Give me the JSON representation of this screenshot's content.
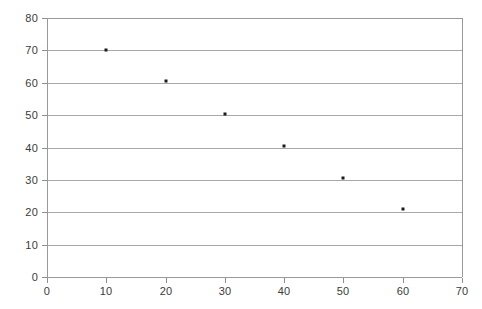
{
  "chart_data": {
    "type": "scatter",
    "title": "",
    "subtitle": "",
    "xlabel": "",
    "ylabel": "",
    "xlim": [
      0,
      70
    ],
    "ylim": [
      0,
      80
    ],
    "grid": "horizontal",
    "legend": "none",
    "x_ticks": [
      0,
      10,
      20,
      30,
      40,
      50,
      60,
      70
    ],
    "y_ticks": [
      0,
      10,
      20,
      30,
      40,
      50,
      60,
      70,
      80
    ],
    "x_tick_labels": [
      "0",
      "10",
      "20",
      "30",
      "40",
      "50",
      "60",
      "70"
    ],
    "y_tick_labels": [
      "0",
      "10",
      "20",
      "30",
      "40",
      "50",
      "60",
      "70",
      "80"
    ],
    "series": [
      {
        "name": "series-1",
        "marker": "square",
        "color": "#1a1a1a",
        "points": [
          {
            "x": 10,
            "y": 70
          },
          {
            "x": 20,
            "y": 60.5
          },
          {
            "x": 30,
            "y": 50.5
          },
          {
            "x": 40,
            "y": 40.5
          },
          {
            "x": 50,
            "y": 30.5
          },
          {
            "x": 60,
            "y": 21
          }
        ],
        "x": [
          10,
          20,
          30,
          40,
          50,
          60
        ],
        "values": [
          70,
          60.5,
          50.5,
          40.5,
          30.5,
          21
        ]
      }
    ],
    "colors": {
      "marker": "#1a1a1a",
      "gridline": "#a8a8a8",
      "axis": "#9a9a9a",
      "tick_label": "#3b3b3b",
      "background": "#ffffff"
    }
  }
}
